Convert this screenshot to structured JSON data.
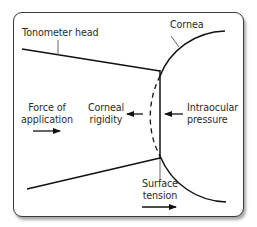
{
  "diagram": {
    "type": "tonometry-forces",
    "labels": {
      "tonometer_head": "Tonometer head",
      "cornea": "Cornea",
      "force_of_application_line1": "Force of",
      "force_of_application_line2": "application",
      "corneal_rigidity_line1": "Corneal",
      "corneal_rigidity_line2": "rigidity",
      "intraocular_pressure_line1": "Intraocular",
      "intraocular_pressure_line2": "pressure",
      "surface_tension_line1": "Surface",
      "surface_tension_line2": "tension"
    },
    "arrows": [
      {
        "label": "Force of application",
        "direction": "right"
      },
      {
        "label": "Corneal rigidity",
        "direction": "left"
      },
      {
        "label": "Intraocular pressure",
        "direction": "left"
      },
      {
        "label": "Surface tension",
        "direction": "right"
      }
    ],
    "colors": {
      "stroke": "#111111",
      "text": "#2b2b2b",
      "border": "#3a3a3a",
      "leader": "#555555"
    }
  }
}
